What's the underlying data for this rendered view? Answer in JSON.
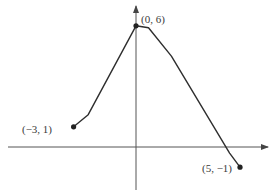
{
  "chart_data": {
    "type": "line",
    "title": "",
    "xlabel": "",
    "ylabel": "",
    "grid": false,
    "legend": null,
    "x": [
      -3,
      -2.3,
      0,
      0.6,
      1.7,
      4.5,
      5
    ],
    "y": [
      1,
      1.6,
      6,
      5.9,
      4.5,
      -0.3,
      -1
    ],
    "labeled_points": [
      {
        "x": -3,
        "y": 1,
        "label": "(−3, 1)"
      },
      {
        "x": 0,
        "y": 6,
        "label": "(0, 6)"
      },
      {
        "x": 5,
        "y": -1,
        "label": "(5, −1)"
      }
    ],
    "xlim": [
      -5,
      6
    ],
    "ylim": [
      -2.5,
      7
    ],
    "axis_arrows": [
      "x-positive",
      "y-positive"
    ]
  },
  "colors": {
    "line": "#2e2e2e",
    "axes": "#444444",
    "background": "#ffffff"
  },
  "labels": {
    "start": "(−3, 1)",
    "peak": "(0, 6)",
    "end": "(5, −1)"
  }
}
